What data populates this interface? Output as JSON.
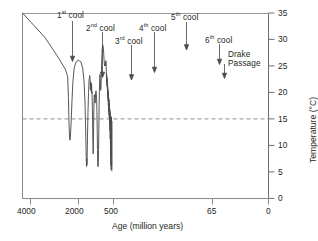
{
  "chart_data": {
    "type": "line",
    "title": "",
    "xlabel": "Age (million years)",
    "ylabel": "Temperature (°C)",
    "xlim": [
      4100,
      0
    ],
    "ylim": [
      0,
      35
    ],
    "grid": false,
    "legend": "none",
    "x_axis": {
      "label": "Age (million years)",
      "tick_labels": [
        "4000",
        "2000",
        "500",
        "65",
        "0"
      ],
      "tick_values": [
        4000,
        2000,
        500,
        65,
        0
      ],
      "note": "non-linear compressed time axis"
    },
    "y_axis": {
      "label": "Temperature (°C)",
      "tick_labels": [
        "0",
        "5",
        "10",
        "15",
        "20",
        "25",
        "30",
        "35"
      ],
      "tick_values": [
        0,
        5,
        10,
        15,
        20,
        25,
        30,
        35
      ],
      "min": 0,
      "max": 35
    },
    "reference_line": {
      "name": "15 °C reference",
      "value": 15,
      "style": "dashed",
      "orientation": "horizontal"
    },
    "series": [
      {
        "name": "Global mean temperature",
        "style": "solid",
        "color": "#4d4d4d",
        "points": [
          [
            4100,
            35.0
          ],
          [
            3400,
            30.4
          ],
          [
            2900,
            27.0
          ],
          [
            2550,
            24.4
          ],
          [
            2450,
            23.0
          ],
          [
            2420,
            19.0
          ],
          [
            2400,
            15.0
          ],
          [
            2380,
            12.2
          ],
          [
            2360,
            11.0
          ],
          [
            2340,
            11.5
          ],
          [
            2310,
            14.0
          ],
          [
            2270,
            18.6
          ],
          [
            2230,
            22.2
          ],
          [
            2180,
            24.6
          ],
          [
            2100,
            25.8
          ],
          [
            2000,
            26.1
          ],
          [
            1900,
            25.8
          ],
          [
            1820,
            24.6
          ],
          [
            1760,
            22.0
          ],
          [
            1720,
            18.0
          ],
          [
            1700,
            14.0
          ],
          [
            1680,
            10.0
          ],
          [
            1665,
            7.2
          ],
          [
            1655,
            6.0
          ],
          [
            1645,
            7.6
          ],
          [
            1638,
            6.3
          ],
          [
            1630,
            7.8
          ],
          [
            1615,
            11.5
          ],
          [
            1595,
            16.0
          ],
          [
            1570,
            20.0
          ],
          [
            1545,
            22.4
          ],
          [
            1520,
            23.2
          ],
          [
            1500,
            22.2
          ],
          [
            1490,
            20.6
          ],
          [
            1480,
            22.0
          ],
          [
            1470,
            20.4
          ],
          [
            1460,
            21.8
          ],
          [
            1450,
            20.2
          ],
          [
            1440,
            21.6
          ],
          [
            1430,
            19.8
          ],
          [
            1420,
            20.2
          ],
          [
            1405,
            17.0
          ],
          [
            1390,
            12.8
          ],
          [
            1378,
            9.6
          ],
          [
            1370,
            8.4
          ],
          [
            1362,
            10.2
          ],
          [
            1352,
            13.8
          ],
          [
            1340,
            17.2
          ],
          [
            1328,
            19.2
          ],
          [
            1315,
            19.6
          ],
          [
            1300,
            18.4
          ],
          [
            1288,
            18.0
          ],
          [
            1275,
            18.8
          ],
          [
            1262,
            20.0
          ],
          [
            1250,
            20.3
          ],
          [
            1236,
            19.8
          ],
          [
            1222,
            18.6
          ],
          [
            1210,
            16.4
          ],
          [
            1196,
            12.6
          ],
          [
            1186,
            9.2
          ],
          [
            1178,
            7.0
          ],
          [
            1170,
            6.0
          ],
          [
            1160,
            6.0
          ],
          [
            1150,
            6.6
          ],
          [
            1140,
            9.0
          ],
          [
            1128,
            13.2
          ],
          [
            1116,
            17.6
          ],
          [
            1104,
            20.4
          ],
          [
            1092,
            22.2
          ],
          [
            1080,
            23.4
          ],
          [
            1070,
            22.6
          ],
          [
            1060,
            21.2
          ],
          [
            1050,
            20.4
          ],
          [
            1038,
            20.8
          ],
          [
            1024,
            22.6
          ],
          [
            1010,
            25.2
          ],
          [
            995,
            27.2
          ],
          [
            980,
            28.5
          ],
          [
            960,
            29.0
          ],
          [
            940,
            28.6
          ],
          [
            920,
            27.4
          ],
          [
            905,
            26.2
          ],
          [
            890,
            25.4
          ],
          [
            878,
            25.0
          ],
          [
            868,
            25.2
          ],
          [
            858,
            25.0
          ],
          [
            848,
            25.6
          ],
          [
            838,
            25.2
          ],
          [
            828,
            26.0
          ],
          [
            818,
            25.6
          ],
          [
            808,
            24.0
          ],
          [
            800,
            22.6
          ],
          [
            795,
            23.6
          ],
          [
            790,
            22.0
          ],
          [
            785,
            23.0
          ],
          [
            780,
            21.4
          ],
          [
            775,
            22.6
          ],
          [
            770,
            21.0
          ],
          [
            765,
            22.2
          ],
          [
            760,
            20.4
          ],
          [
            755,
            21.6
          ],
          [
            750,
            19.6
          ],
          [
            745,
            21.0
          ],
          [
            740,
            19.0
          ],
          [
            735,
            20.4
          ],
          [
            730,
            18.4
          ],
          [
            725,
            20.0
          ],
          [
            720,
            17.6
          ],
          [
            715,
            19.4
          ],
          [
            710,
            17.0
          ],
          [
            705,
            19.0
          ],
          [
            700,
            16.4
          ],
          [
            695,
            18.6
          ],
          [
            690,
            15.8
          ],
          [
            685,
            18.0
          ],
          [
            680,
            15.2
          ],
          [
            675,
            17.6
          ],
          [
            670,
            14.4
          ],
          [
            665,
            17.0
          ],
          [
            660,
            13.8
          ],
          [
            655,
            16.6
          ],
          [
            650,
            12.8
          ],
          [
            645,
            16.2
          ],
          [
            640,
            11.2
          ],
          [
            635,
            15.8
          ],
          [
            630,
            9.6
          ],
          [
            625,
            15.4
          ],
          [
            620,
            8.0
          ],
          [
            615,
            15.2
          ],
          [
            610,
            6.2
          ],
          [
            605,
            15.0
          ],
          [
            600,
            5.4
          ],
          [
            595,
            14.8
          ],
          [
            590,
            8.6
          ],
          [
            585,
            15.4
          ],
          [
            580,
            6.0
          ],
          [
            575,
            14.6
          ],
          [
            570,
            5.2
          ]
        ]
      }
    ],
    "annotations": [
      {
        "name": "first-cool",
        "label": "1st cool",
        "ordinal": "1",
        "suffix": "st",
        "word": "cool",
        "arrow": "down"
      },
      {
        "name": "second-cool",
        "label": "2nd cool",
        "ordinal": "2",
        "suffix": "nd",
        "word": "cool",
        "arrow": "down"
      },
      {
        "name": "third-cool",
        "label": "3rd cool",
        "ordinal": "3",
        "suffix": "rd",
        "word": "cool",
        "arrow": "down"
      },
      {
        "name": "fourth-cool",
        "label": "4th cool",
        "ordinal": "4",
        "suffix": "th",
        "word": "cool",
        "arrow": "down"
      },
      {
        "name": "fifth-cool",
        "label": "5th cool",
        "ordinal": "5",
        "suffix": "th",
        "word": "cool",
        "arrow": "down"
      },
      {
        "name": "sixth-cool",
        "label": "6th cool",
        "ordinal": "6",
        "suffix": "th",
        "word": "cool",
        "arrow": "down"
      },
      {
        "name": "drake-passage",
        "label": "Drake Passage",
        "line1": "Drake",
        "line2": "Passage",
        "arrow": "down"
      }
    ]
  },
  "annotations": {
    "cool1": {
      "ordinal": "1",
      "suffix": "st",
      "word": "cool"
    },
    "cool2": {
      "ordinal": "2",
      "suffix": "nd",
      "word": "cool"
    },
    "cool3": {
      "ordinal": "3",
      "suffix": "rd",
      "word": "cool"
    },
    "cool4": {
      "ordinal": "4",
      "suffix": "th",
      "word": "cool"
    },
    "cool5": {
      "ordinal": "5",
      "suffix": "th",
      "word": "cool"
    },
    "cool6": {
      "ordinal": "6",
      "suffix": "th",
      "word": "cool"
    },
    "drake": {
      "line1": "Drake",
      "line2": "Passage"
    }
  },
  "axes": {
    "x_title": "Age (million years)",
    "y_title": "Temperature (°C)",
    "x_ticks": [
      "4000",
      "2000",
      "500",
      "65",
      "0"
    ],
    "y_ticks": [
      "35",
      "30",
      "25",
      "20",
      "15",
      "10",
      "5",
      "0"
    ]
  },
  "colors": {
    "curve": "#4d4d4d",
    "axis": "#6e6e6e",
    "text": "#231f20",
    "dashed": "#8c8c8c"
  }
}
